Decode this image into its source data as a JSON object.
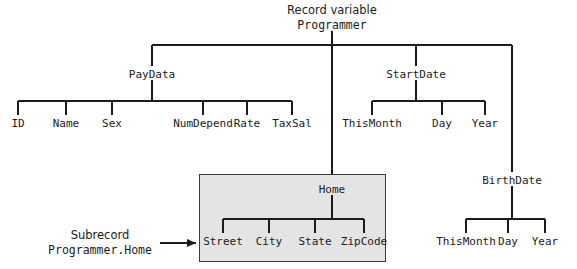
{
  "diagram": {
    "title_line1": "Record variable",
    "title_line2": "Programmer",
    "subrecord_caption_line1": "Subrecord",
    "subrecord_caption_line2": "Programmer.Home",
    "colors": {
      "line": "#1b1b1b",
      "text": "#1b1b1b",
      "background": "#ffffff",
      "box_fill": "#e4e4e4",
      "box_border": "#3a3a3a"
    },
    "nodes": {
      "paydata": "PayData",
      "id": "ID",
      "name": "Name",
      "sex": "Sex",
      "numdepend": "NumDepend",
      "rate": "Rate",
      "taxsal": "TaxSal",
      "startdate": "StartDate",
      "start_thismonth": "ThisMonth",
      "start_day": "Day",
      "start_year": "Year",
      "home": "Home",
      "street": "Street",
      "city": "City",
      "state": "State",
      "zipcode": "ZipCode",
      "birthdate": "BirthDate",
      "birth_thismonth": "ThisMonth",
      "birth_day": "Day",
      "birth_year": "Year"
    }
  }
}
